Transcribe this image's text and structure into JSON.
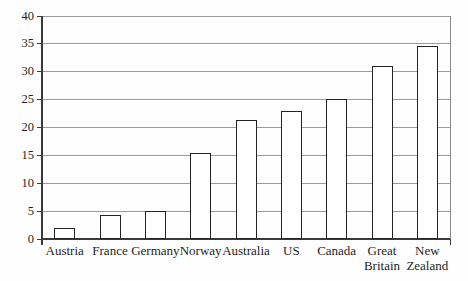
{
  "chart_data": {
    "type": "bar",
    "categories": [
      "Austria",
      "France",
      "Germany",
      "Norway",
      "Australia",
      "US",
      "Canada",
      "Great Britain",
      "New Zealand"
    ],
    "values": [
      2,
      4.3,
      5,
      15.4,
      21.3,
      23,
      25.2,
      31.1,
      34.6
    ],
    "title": "",
    "xlabel": "",
    "ylabel": "",
    "ylim": [
      0,
      40
    ],
    "yticks": [
      0,
      5,
      10,
      15,
      20,
      25,
      30,
      35,
      40
    ],
    "grid": true,
    "legend": "none",
    "bar_fill": "#ffffff",
    "bar_border": "#232323",
    "gridline_color": "#9b9b9b",
    "axis_color": "#3a3a3a",
    "right_border_color": "#8a8a8a",
    "text_color": "#1f1f1f",
    "background": "#fefefe"
  }
}
